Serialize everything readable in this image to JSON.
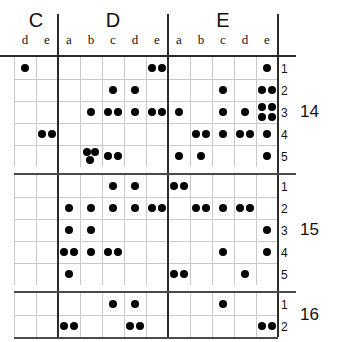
{
  "figure": {
    "kind": "braille-style dot matrix table",
    "groups": [
      {
        "name": "C",
        "columns": [
          "d",
          "e"
        ]
      },
      {
        "name": "D",
        "columns": [
          "a",
          "b",
          "c",
          "d",
          "e"
        ]
      },
      {
        "name": "E",
        "columns": [
          "a",
          "b",
          "c",
          "d",
          "e"
        ]
      }
    ],
    "column_keys": [
      "C.d",
      "C.e",
      "D.a",
      "D.b",
      "D.c",
      "D.d",
      "D.e",
      "E.a",
      "E.b",
      "E.c",
      "E.d",
      "E.e"
    ],
    "blocks": [
      {
        "label": "14",
        "rows": [
          "1",
          "2",
          "3",
          "4",
          "5"
        ]
      },
      {
        "label": "15",
        "rows": [
          "1",
          "2",
          "3",
          "4",
          "5"
        ]
      },
      {
        "label": "16",
        "rows": [
          "1",
          "2"
        ]
      }
    ],
    "colors": {
      "dot": "#000000",
      "thin_rule": "#c9c9c9",
      "thick_rule": "#2b2b2b",
      "background": "#ffffff"
    }
  },
  "chart_data": {
    "type": "heatmap",
    "title": "",
    "xlabel": "",
    "ylabel": "",
    "categories": [
      "C.d",
      "C.e",
      "D.a",
      "D.b",
      "D.c",
      "D.d",
      "D.e",
      "E.a",
      "E.b",
      "E.c",
      "E.d",
      "E.e"
    ],
    "row_labels": [
      "14.1",
      "14.2",
      "14.3",
      "14.4",
      "14.5",
      "15.1",
      "15.2",
      "15.3",
      "15.4",
      "15.5",
      "16.1",
      "16.2"
    ],
    "legend": [],
    "note": "Each cell value is the number of dots drawn in that cell (0 = empty).",
    "values": [
      [
        1,
        0,
        0,
        0,
        0,
        0,
        2,
        0,
        0,
        0,
        0,
        1
      ],
      [
        0,
        0,
        0,
        0,
        1,
        1,
        0,
        0,
        0,
        1,
        0,
        2
      ],
      [
        0,
        0,
        0,
        1,
        2,
        1,
        2,
        1,
        0,
        1,
        1,
        4
      ],
      [
        0,
        2,
        0,
        0,
        0,
        0,
        0,
        0,
        2,
        1,
        2,
        1
      ],
      [
        0,
        0,
        0,
        3,
        2,
        0,
        0,
        1,
        1,
        0,
        0,
        1
      ],
      [
        0,
        0,
        0,
        0,
        1,
        1,
        0,
        2,
        0,
        0,
        0,
        0
      ],
      [
        0,
        0,
        1,
        1,
        1,
        1,
        2,
        0,
        2,
        1,
        2,
        0
      ],
      [
        0,
        0,
        1,
        1,
        0,
        0,
        0,
        0,
        0,
        0,
        0,
        1
      ],
      [
        0,
        0,
        2,
        1,
        2,
        0,
        0,
        0,
        0,
        1,
        0,
        1
      ],
      [
        0,
        0,
        1,
        0,
        0,
        0,
        0,
        2,
        0,
        0,
        1,
        0
      ],
      [
        0,
        0,
        0,
        0,
        1,
        1,
        0,
        0,
        0,
        1,
        0,
        0
      ],
      [
        0,
        0,
        2,
        0,
        0,
        2,
        0,
        0,
        0,
        0,
        0,
        2
      ]
    ]
  }
}
